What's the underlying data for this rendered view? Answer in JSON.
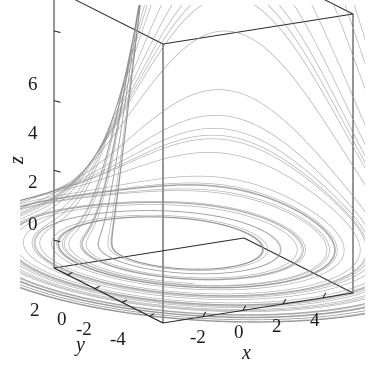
{
  "figure": {
    "kind": "3d-phase-portrait",
    "width": 371,
    "height": 370,
    "background_color": "#ffffff",
    "box_line_color": "#2b2b2b",
    "trajectory_color": "#8c8c8c"
  },
  "axes": {
    "x": {
      "title": "x",
      "tick_labels": [
        "-2",
        "0",
        "2",
        "4"
      ],
      "tick_values": [
        -2,
        0,
        2,
        4
      ],
      "range": [
        -4,
        5.5
      ]
    },
    "y": {
      "title": "y",
      "tick_labels": [
        "2",
        "0",
        "-2",
        "-4"
      ],
      "tick_values": [
        2,
        0,
        -2,
        -4
      ],
      "range": [
        -5,
        3
      ]
    },
    "z": {
      "title": "z",
      "tick_labels": [
        "0",
        "2",
        "4",
        "6"
      ],
      "tick_values": [
        0,
        2,
        4,
        6
      ],
      "range": [
        -0.8,
        7.2
      ]
    }
  },
  "chart_data": {
    "type": "line",
    "title": "",
    "subtitle": "",
    "xlabel": "x",
    "ylabel": "y",
    "zlabel": "z",
    "xlim": [
      -4,
      5.5
    ],
    "ylim": [
      -5,
      3
    ],
    "zlim": [
      -0.8,
      7.2
    ],
    "grid": false,
    "legend": null,
    "annotations": [],
    "series": [
      {
        "name": "chaotic attractor trajectory",
        "system": "roessler",
        "params": {
          "a": 0.2,
          "b": 0.2,
          "c": 5.7
        },
        "initial_conditions": {
          "x": 1.0,
          "y": 1.0,
          "z": 0.5
        },
        "integration": {
          "dt": 0.006,
          "steps": 46000,
          "transient_steps": 2500
        },
        "color": "#8c8c8c",
        "line_width": 0.65
      }
    ],
    "view": {
      "projection": "orthographic",
      "azimuth_deg": -60,
      "elevation_deg": 22
    }
  },
  "ticks": {
    "x": [
      {
        "label": "-2",
        "left": 190,
        "top": 326
      },
      {
        "label": "0",
        "left": 232,
        "top": 323
      },
      {
        "label": "2",
        "left": 270,
        "top": 318
      },
      {
        "label": "4",
        "left": 308,
        "top": 312
      }
    ],
    "y": [
      {
        "label": "2",
        "left": 30,
        "top": 300
      },
      {
        "label": "0",
        "left": 57,
        "top": 309
      },
      {
        "label": "-2",
        "left": 77,
        "top": 318
      },
      {
        "label": "-4",
        "left": 110,
        "top": 327
      }
    ],
    "z": [
      {
        "label": "0",
        "left": 28,
        "top": 214
      },
      {
        "label": "2",
        "left": 28,
        "top": 172
      },
      {
        "label": "4",
        "left": 28,
        "top": 123
      },
      {
        "label": "6",
        "left": 28,
        "top": 74
      }
    ]
  },
  "titles": {
    "x": {
      "label": "x",
      "left": 241,
      "top": 345
    },
    "y": {
      "label": "y",
      "left": 75,
      "top": 337
    },
    "z": {
      "label": "z",
      "left": 12,
      "top": 152
    }
  }
}
